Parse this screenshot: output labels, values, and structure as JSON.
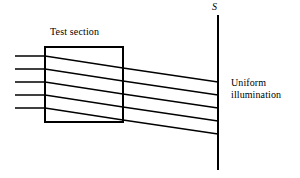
{
  "figure": {
    "width": 300,
    "height": 178,
    "background_color": "#ffffff",
    "stroke_color": "#000000"
  },
  "labels": {
    "test_section": "Test section",
    "screen": "S",
    "illumination_line1": "Uniform",
    "illumination_line2": "illumination"
  },
  "chart_data": {
    "type": "diagram",
    "elements": {
      "test_section_box": {
        "x": 45,
        "y": 47,
        "width": 78,
        "height": 75,
        "stroke_width": 2,
        "label": "Test section"
      },
      "screen": {
        "label": "S",
        "x": 218,
        "y_top": 15,
        "y_bottom": 170,
        "stroke_width": 2
      },
      "illumination_note": {
        "x": 231,
        "y": 77,
        "lines": [
          "Uniform",
          "illumination"
        ]
      }
    },
    "rays": [
      {
        "index": 1,
        "entry_x": 15,
        "entry_y": 56,
        "box_entry_x": 45,
        "box_entry_y": 56,
        "box_exit_x": 123,
        "box_exit_y": 68,
        "screen_x": 218,
        "screen_y": 82
      },
      {
        "index": 2,
        "entry_x": 15,
        "entry_y": 69,
        "box_entry_x": 45,
        "box_entry_y": 69,
        "box_exit_x": 123,
        "box_exit_y": 81,
        "screen_x": 218,
        "screen_y": 95
      },
      {
        "index": 3,
        "entry_x": 15,
        "entry_y": 82,
        "box_entry_x": 45,
        "box_entry_y": 82,
        "box_exit_x": 123,
        "box_exit_y": 94,
        "screen_x": 218,
        "screen_y": 108
      },
      {
        "index": 4,
        "entry_x": 15,
        "entry_y": 95,
        "box_entry_x": 45,
        "box_entry_y": 95,
        "box_exit_x": 123,
        "box_exit_y": 107,
        "screen_x": 218,
        "screen_y": 121
      },
      {
        "index": 5,
        "entry_x": 15,
        "entry_y": 108,
        "box_entry_x": 45,
        "box_entry_y": 108,
        "box_exit_x": 123,
        "box_exit_y": 120,
        "screen_x": 218,
        "screen_y": 134
      }
    ],
    "ray_count": 5,
    "ray_stroke_width": 1.3
  }
}
